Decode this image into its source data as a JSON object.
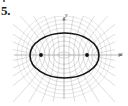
{
  "figure": {
    "number_label": "5.",
    "caption": ""
  },
  "axes": {
    "x_label": "x",
    "y_label": "y",
    "origin_px": {
      "x": 64,
      "y": 55
    },
    "x_axis_span_px": {
      "from": 14,
      "to": 122
    },
    "y_axis_span_px": {
      "from": 17,
      "to": 99
    },
    "arrow_x": "right",
    "arrow_y": "up"
  },
  "colors": {
    "background": "#ffffff",
    "axis": "#7b7b7b",
    "net_light": "#9a9a9a",
    "net_mid": "#6e6e6e",
    "emphasis_curve": "#141414",
    "focus_point": "#101010",
    "label_text": "#1b1b1b"
  },
  "chart_data": {
    "type": "line",
    "title": "",
    "subtitle": "",
    "xlabel": "x",
    "ylabel": "y",
    "xlim": [
      -2.6,
      2.6
    ],
    "ylim": [
      -2.0,
      2.0
    ],
    "grid": false,
    "legend": null,
    "foci": [
      {
        "name": "F1",
        "x": -0.58,
        "y": 0.0,
        "px": {
          "x": 41,
          "y": 55
        }
      },
      {
        "name": "F2",
        "x": 0.58,
        "y": 0.0,
        "px": {
          "x": 87,
          "y": 55
        }
      }
    ],
    "focal_distance_c": 0.58,
    "emphasis": {
      "name": "highlighted-ellipse",
      "kind": "ellipse",
      "semi_major_a": 0.88,
      "semi_minor_b": 0.66,
      "center": [
        0.0,
        0.0
      ],
      "px_center": {
        "x": 64.5,
        "y": 55.5
      },
      "px_rx": 34.5,
      "px_ry": 22.5,
      "stroke_width": 1.6
    },
    "series": [
      {
        "name": "ellipse-1",
        "kind": "ellipse",
        "a": 0.62,
        "px_rx": 6.5,
        "px_ry": 2.9
      },
      {
        "name": "ellipse-2",
        "kind": "ellipse",
        "a": 0.66,
        "px_rx": 11.0,
        "px_ry": 9.4
      },
      {
        "name": "ellipse-3",
        "kind": "ellipse",
        "a": 0.71,
        "px_rx": 15.5,
        "px_ry": 14.0
      },
      {
        "name": "ellipse-4",
        "kind": "ellipse",
        "a": 0.77,
        "px_rx": 20.0,
        "px_ry": 18.3
      },
      {
        "name": "ellipse-5",
        "kind": "ellipse",
        "a": 0.83,
        "px_rx": 24.5,
        "px_ry": 22.4
      },
      {
        "name": "ellipse-6",
        "kind": "ellipse",
        "a": 0.9,
        "px_rx": 29.0,
        "px_ry": 27.0
      },
      {
        "name": "ellipse-7",
        "kind": "ellipse",
        "a": 0.97,
        "px_rx": 33.5,
        "px_ry": 31.2
      },
      {
        "name": "ellipse-8",
        "kind": "ellipse",
        "a": 1.05,
        "px_rx": 38.0,
        "px_ry": 35.2
      },
      {
        "name": "ellipse-9",
        "kind": "ellipse",
        "a": 1.13,
        "px_rx": 42.5,
        "px_ry": 39.0
      },
      {
        "name": "ellipse-10",
        "kind": "ellipse",
        "a": 1.22,
        "px_rx": 47.0,
        "px_ry": 43.0
      },
      {
        "name": "hyperbola-1",
        "kind": "hyperbola",
        "a": 0.07,
        "px_a": 4.0
      },
      {
        "name": "hyperbola-2",
        "kind": "hyperbola",
        "a": 0.14,
        "px_a": 8.0
      },
      {
        "name": "hyperbola-3",
        "kind": "hyperbola",
        "a": 0.21,
        "px_a": 12.0
      },
      {
        "name": "hyperbola-4",
        "kind": "hyperbola",
        "a": 0.28,
        "px_a": 16.0
      },
      {
        "name": "hyperbola-5",
        "kind": "hyperbola",
        "a": 0.35,
        "px_a": 20.0
      },
      {
        "name": "hyperbola-6",
        "kind": "hyperbola",
        "a": 0.42,
        "px_a": 23.0
      },
      {
        "name": "hyperbola-7",
        "kind": "hyperbola",
        "a": 0.48,
        "px_a": 25.5
      },
      {
        "name": "hyperbola-8",
        "kind": "hyperbola",
        "a": 0.52,
        "px_a": 27.5
      }
    ],
    "annotations": [
      {
        "text": "5.",
        "role": "figure-number"
      },
      {
        "text": "y",
        "role": "axis-label"
      },
      {
        "text": "x",
        "role": "axis-label"
      }
    ]
  }
}
